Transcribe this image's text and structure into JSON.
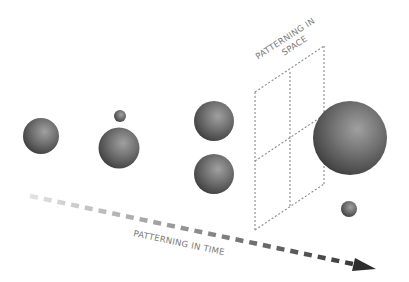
{
  "diagram": {
    "labels": {
      "space_line1": "PATTERNING IN",
      "space_line2": "SPACE",
      "time": "PATTERNING IN TIME"
    },
    "colors": {
      "background": "#ffffff",
      "sphere_light": "#9a9a9a",
      "sphere_mid": "#6a6a6a",
      "sphere_dark": "#3a3a3a",
      "grid_dots": "#8a8a8a",
      "arrow_start": "#e2e2e2",
      "arrow_end": "#2e2e2e",
      "label_text": "#7a7a7a"
    },
    "spheres": [
      {
        "id": "sphere-1",
        "cx": 41,
        "cy": 136,
        "r": 18
      },
      {
        "id": "sphere-tiny",
        "cx": 120,
        "cy": 116,
        "r": 6
      },
      {
        "id": "sphere-2",
        "cx": 119,
        "cy": 148,
        "r": 20.5
      },
      {
        "id": "sphere-3-top",
        "cx": 214,
        "cy": 121,
        "r": 20
      },
      {
        "id": "sphere-3-bottom",
        "cx": 214,
        "cy": 174,
        "r": 20
      },
      {
        "id": "sphere-large",
        "cx": 350,
        "cy": 138,
        "r": 37
      },
      {
        "id": "sphere-small",
        "cx": 349,
        "cy": 209,
        "r": 8
      }
    ],
    "grid": {
      "left_x": 255,
      "mid_x": 290,
      "right_x": 324,
      "left_top": 92,
      "left_bottom": 230,
      "right_top": 46,
      "right_bottom": 184
    },
    "arrow": {
      "x1": 30,
      "y1": 196,
      "x2": 376,
      "y2": 269
    }
  }
}
